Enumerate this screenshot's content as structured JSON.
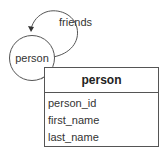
{
  "diagram": {
    "node": {
      "label": "person",
      "shape": "circle"
    },
    "self_edge": {
      "label": "friends",
      "direction": "loop back to person"
    },
    "entity": {
      "title": "person",
      "attributes": [
        "person_id",
        "first_name",
        "last_name"
      ]
    },
    "colors": {
      "stroke": "#555555",
      "text": "#333333",
      "background": "#ffffff"
    }
  }
}
